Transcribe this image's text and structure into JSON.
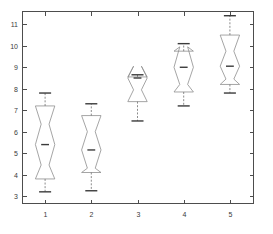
{
  "figure": {
    "title": "",
    "background_color": "#ffffff",
    "plot_area": {
      "left": 22,
      "top": 11,
      "right": 253,
      "bottom": 203
    }
  },
  "colors": {
    "axis": "#4d4d4d",
    "box": "#8e8e8e",
    "median": "#3b3b3b",
    "whisker": "#6f6f6f",
    "cap": "#3b3b3b",
    "tick_text": "#3a3a3a"
  },
  "axes": {
    "x": {
      "label": "",
      "tick_labels": [
        "1",
        "2",
        "3",
        "4",
        "5"
      ],
      "tick_values": [
        1,
        2,
        3,
        4,
        5
      ],
      "range": [
        0.5,
        5.5
      ]
    },
    "y": {
      "label": "",
      "tick_labels": [
        "3",
        "4",
        "5",
        "6",
        "7",
        "8",
        "9",
        "10",
        "11"
      ],
      "tick_values": [
        3,
        4,
        5,
        6,
        7,
        8,
        9,
        10,
        11
      ],
      "range": [
        2.68,
        11.62
      ]
    },
    "grid": false,
    "box_frame": true
  },
  "chart_data": {
    "type": "box",
    "title": "",
    "xlabel": "",
    "ylabel": "",
    "xlim": [
      0.5,
      5.5
    ],
    "ylim": [
      2.68,
      11.62
    ],
    "grid": false,
    "legend": null,
    "notched": true,
    "box_width": 0.42,
    "notch_width": 0.17,
    "categories": [
      "1",
      "2",
      "3",
      "4",
      "5"
    ],
    "boxes": [
      {
        "category": "1",
        "position": 1,
        "whisker_low": 3.2,
        "q1": 3.8,
        "median": 5.4,
        "q3": 7.2,
        "whisker_high": 7.8,
        "notch_low": 4.45,
        "notch_high": 6.35,
        "outliers": []
      },
      {
        "category": "2",
        "position": 2,
        "whisker_low": 3.25,
        "q1": 4.1,
        "median": 5.15,
        "q3": 6.75,
        "whisker_high": 7.3,
        "notch_low": 4.3,
        "notch_high": 6.0,
        "outliers": []
      },
      {
        "category": "3",
        "position": 3,
        "whisker_low": 6.5,
        "q1": 7.4,
        "median": 8.5,
        "q3": 8.55,
        "whisker_high": 8.65,
        "notch_low": 7.95,
        "notch_high": 9.05,
        "outliers": []
      },
      {
        "category": "4",
        "position": 4,
        "whisker_low": 7.2,
        "q1": 7.85,
        "median": 9.0,
        "q3": 9.75,
        "whisker_high": 10.1,
        "notch_low": 8.2,
        "notch_high": 9.95,
        "outliers": []
      },
      {
        "category": "5",
        "position": 5,
        "whisker_low": 7.8,
        "q1": 8.2,
        "median": 9.05,
        "q3": 10.5,
        "whisker_high": 11.4,
        "notch_low": 8.45,
        "notch_high": 9.75,
        "outliers": []
      }
    ]
  }
}
